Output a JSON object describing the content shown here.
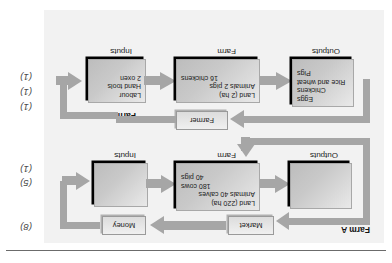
{
  "page": {
    "divider": "horizontal-rule"
  },
  "marks": {
    "farm_b": [
      "(1)",
      "(5)",
      "(8)"
    ],
    "farm_a": [
      "(1)",
      "(1)",
      "(1)"
    ]
  },
  "farm_b": {
    "title": "Farm B",
    "captions": {
      "inputs": "Inputs",
      "farm": "Farm",
      "outputs": "Outputs"
    },
    "inputs_box": {
      "lines": [
        "Labour",
        "Hand tools",
        "2 oxen"
      ]
    },
    "farm_box": {
      "land_label": "Land",
      "land_value": "(2 ha)",
      "animals_label": "Animals",
      "animals_lines": [
        "2 pigs",
        "16 chickens"
      ]
    },
    "outputs_box": {
      "lines": [
        "Eggs",
        "Chickens",
        "Rice and wheat",
        "Pigs"
      ]
    },
    "farmer_box": "Farmer"
  },
  "farm_a": {
    "title": "Farm A",
    "captions": {
      "inputs": "Inputs",
      "farm": "Farm",
      "outputs": "Outputs"
    },
    "inputs_box": {
      "lines": []
    },
    "farm_box": {
      "land_label": "Land",
      "land_value": "(220 ha)",
      "animals_label": "Animals",
      "animals_lines": [
        "40 calves",
        "180 cows",
        "40 pigs"
      ]
    },
    "outputs_box": {
      "lines": []
    },
    "money_box": "Money",
    "market_box": "Market"
  },
  "colors": {
    "panel_bg": "#f2f2f2",
    "box_fill": "#c9c9c9",
    "arrow": "#a6a6a6",
    "shadow": "#000000",
    "text": "#1a1a1a"
  }
}
